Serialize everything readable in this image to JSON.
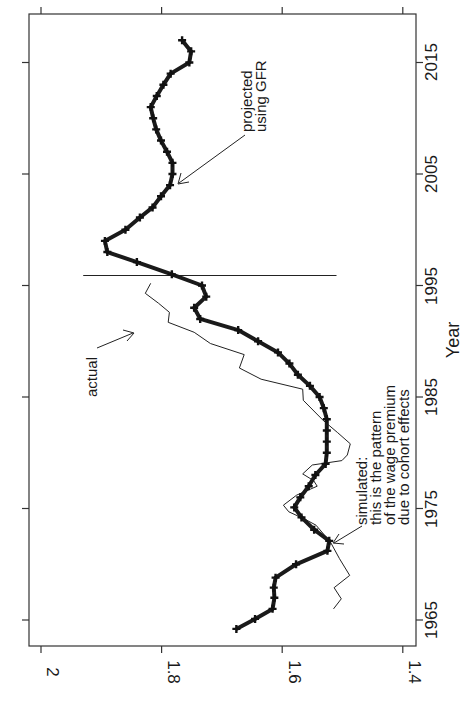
{
  "chart_data": {
    "type": "line",
    "title": "",
    "xlabel": "Year",
    "ylabel": "",
    "orientation": "rotated-90-clockwise",
    "xlim": [
      1963.8,
      2019.5
    ],
    "ylim": [
      1.38,
      2.02
    ],
    "x_ticks": [
      1965,
      1975,
      1985,
      1995,
      2005,
      2015
    ],
    "y_ticks": [
      2,
      1.8,
      1.6,
      1.4
    ],
    "y_tick_labels": [
      "2",
      "1.8",
      "1.6",
      "1.4"
    ],
    "grid": false,
    "vertical_line_year": 1995.9,
    "vertical_line_yrange": [
      1.51,
      1.93
    ],
    "series": [
      {
        "name": "simulated / projected using GFR",
        "style": "thick-with-markers",
        "x": [
          1964.2,
          1965.1,
          1966.0,
          1967.0,
          1967.9,
          1968.8,
          1970.0,
          1971.2,
          1972.1,
          1973.1,
          1974.2,
          1975.1,
          1976.0,
          1977.0,
          1978.0,
          1979.0,
          1980.0,
          1981.0,
          1982.0,
          1983.0,
          1984.0,
          1985.0,
          1986.0,
          1987.0,
          1988.0,
          1989.0,
          1990.0,
          1991.0,
          1992.0,
          1993.0,
          1994.0,
          1995.0,
          1996.0,
          1997.1,
          1998.0,
          1999.0,
          2000.0,
          2001.1,
          2002.0,
          2003.0,
          2004.0,
          2005.0,
          2006.0,
          2007.0,
          2008.0,
          2009.0,
          2010.0,
          2011.0,
          2012.0,
          2013.0,
          2014.0,
          2015.0,
          2016.0,
          2017.0
        ],
        "y": [
          1.676,
          1.645,
          1.616,
          1.613,
          1.614,
          1.611,
          1.577,
          1.525,
          1.522,
          1.547,
          1.568,
          1.58,
          1.57,
          1.556,
          1.545,
          1.528,
          1.526,
          1.526,
          1.526,
          1.526,
          1.531,
          1.538,
          1.554,
          1.574,
          1.588,
          1.607,
          1.64,
          1.673,
          1.736,
          1.746,
          1.726,
          1.733,
          1.783,
          1.841,
          1.89,
          1.894,
          1.86,
          1.836,
          1.815,
          1.801,
          1.786,
          1.782,
          1.782,
          1.791,
          1.801,
          1.809,
          1.814,
          1.818,
          1.808,
          1.797,
          1.785,
          1.754,
          1.751,
          1.766
        ]
      },
      {
        "name": "actual",
        "style": "thin",
        "x": [
          1966.0,
          1966.9,
          1967.9,
          1969.0,
          1970.5,
          1972.0,
          1973.5,
          1974.0,
          1974.7,
          1975.3,
          1976.2,
          1977.0,
          1977.5,
          1978.1,
          1978.9,
          1979.3,
          1979.8,
          1980.8,
          1981.8,
          1982.9,
          1984.7,
          1985.7,
          1986.6,
          1987.6,
          1988.8,
          1989.8,
          1990.8,
          1991.7,
          1992.6,
          1993.4,
          1994.3,
          1995.2
        ],
        "y": [
          1.515,
          1.502,
          1.514,
          1.488,
          1.505,
          1.52,
          1.544,
          1.561,
          1.589,
          1.598,
          1.576,
          1.542,
          1.548,
          1.566,
          1.55,
          1.501,
          1.492,
          1.487,
          1.508,
          1.532,
          1.565,
          1.566,
          1.635,
          1.671,
          1.663,
          1.719,
          1.746,
          1.789,
          1.787,
          1.805,
          1.827,
          1.818
        ]
      }
    ],
    "annotations": [
      {
        "text_lines": [
          "projected",
          "using GFR"
        ],
        "points_to_year": 2004.2,
        "points_to_value": 1.79
      },
      {
        "text_lines": [
          "actual"
        ],
        "points_to_year": 1991.0,
        "points_to_value": 1.81
      },
      {
        "text_lines": [
          "simulated:",
          "this is the pattern",
          "of the wage premium",
          "due to cohort effects"
        ],
        "points_to_year": 1971.8,
        "points_to_value": 1.52
      }
    ]
  },
  "labels": {
    "x_axis_title": "Year",
    "x_tick_labels": [
      "1965",
      "1975",
      "1985",
      "1995",
      "2005",
      "2015"
    ],
    "y_tick_labels": [
      "2",
      "1.8",
      "1.6",
      "1.4"
    ],
    "annotation_projected_1": "projected",
    "annotation_projected_2": "using GFR",
    "annotation_actual": "actual",
    "annotation_sim_1": "simulated:",
    "annotation_sim_2": "this is the pattern",
    "annotation_sim_3": "of the wage premium",
    "annotation_sim_4": "due to cohort effects"
  }
}
